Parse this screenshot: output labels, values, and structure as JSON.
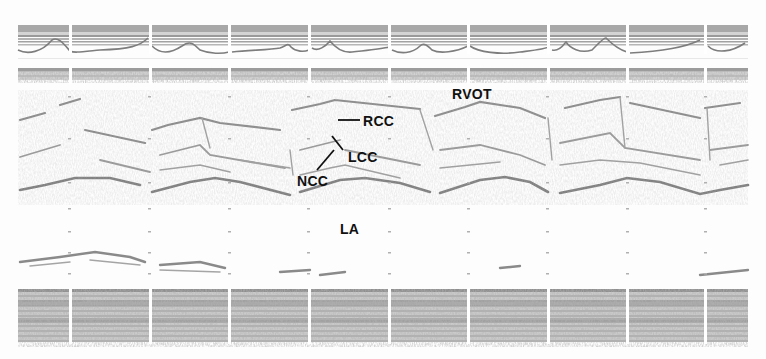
{
  "figure": {
    "type": "M-mode echocardiogram",
    "background": "#fdfdfd",
    "ink_color": "#8a8a8a",
    "dark_ink": "#6e6e6e",
    "marker_color": "#ffffff",
    "time_markers_x": [
      70,
      150,
      229,
      309,
      389,
      468,
      548,
      627,
      705
    ],
    "labels": {
      "rvot": "RVOT",
      "rcc": "RCC",
      "lcc": "LCC",
      "ncc": "NCC",
      "la": "LA"
    }
  }
}
